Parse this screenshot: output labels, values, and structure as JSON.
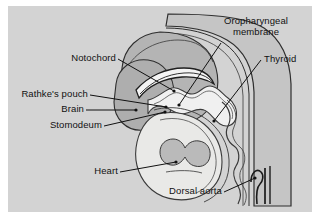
{
  "figure": {
    "panel_background": "#d3d3d3",
    "page_background": "#ffffff",
    "line_color": "#111111",
    "label_text_color": "#111111"
  },
  "labels": [
    {
      "id": "oropharyngeal-membrane",
      "text_line1": "Oropharyngeal",
      "text_line2": "membrane",
      "full_text": "Oropharyngeal membrane",
      "position": "top-right"
    },
    {
      "id": "thyroid",
      "full_text": "Thyroid",
      "position": "right"
    },
    {
      "id": "notochord",
      "full_text": "Notochord",
      "position": "upper-left"
    },
    {
      "id": "rathkes-pouch",
      "full_text": "Rathke's pouch",
      "position": "left"
    },
    {
      "id": "brain",
      "full_text": "Brain",
      "position": "left"
    },
    {
      "id": "stomodeum",
      "full_text": "Stomodeum",
      "position": "left"
    },
    {
      "id": "heart",
      "full_text": "Heart",
      "position": "bottom-left"
    },
    {
      "id": "dorsal-aorta",
      "full_text": "Dorsal aorta",
      "position": "bottom-right"
    }
  ],
  "anatomy_regions": [
    {
      "id": "body-outline",
      "name": "embryo body outline",
      "fill": "#c2c2c2"
    },
    {
      "id": "head-mass",
      "name": "head / brain region",
      "fill": "#b2b2b2"
    },
    {
      "id": "brain-mass",
      "name": "brain",
      "fill": "#adadad"
    },
    {
      "id": "notochord-band",
      "name": "notochord",
      "fill": "#f2f2f2"
    },
    {
      "id": "foregut-lumen",
      "name": "foregut / pharynx lumen",
      "fill": "#f0f0f0"
    },
    {
      "id": "heart-region",
      "name": "heart and pericardial cavity",
      "fill": "#e8e8e6"
    },
    {
      "id": "heart-chambers",
      "name": "heart chambers",
      "fill": "#b8b8b8"
    },
    {
      "id": "dorsal-aorta-vessels",
      "name": "dorsal aorta vessels",
      "fill": "#2b2b2b"
    }
  ]
}
